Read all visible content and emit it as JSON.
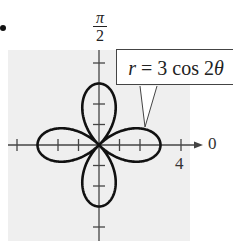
{
  "chart_data": {
    "type": "line",
    "coordinate_system": "polar",
    "title": "",
    "equation": "r = 3 cos 2θ",
    "annotation": {
      "text_var": "r",
      "text_rest": " = 3 cos 2",
      "text_theta": "θ",
      "full_text": "r = 3 cos 2θ"
    },
    "axis_labels": {
      "polar_axis": "0",
      "vertical_top_num": "π",
      "vertical_top_den": "2"
    },
    "tick_labels": {
      "r_axis_4": "4"
    },
    "r_ticks": [
      1,
      2,
      3,
      4
    ],
    "r_range": [
      -4,
      4
    ],
    "petals": 4,
    "petal_length": 3,
    "petal_directions_deg": [
      0,
      90,
      180,
      270
    ],
    "grid": false,
    "background": "#efefef",
    "curve_color": "#111111",
    "axis_color": "#444444"
  }
}
